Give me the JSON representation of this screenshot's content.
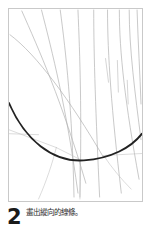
{
  "page": {
    "background_color": "#ffffff",
    "width": 152,
    "height": 235
  },
  "illustration": {
    "name": "drawing-step-illustration",
    "frame": {
      "border_color": "#c9c9c9",
      "fill_color": "#ffffff"
    },
    "description": "Sketch of a fan/shell shape: many thin curved radiating construction lines converging toward the upper right, crossed by a bold dark U-shaped arc forming the lower boundary.",
    "stroke_colors": {
      "construction_line": "#b0b0b0",
      "emphasis_arc": "#222222",
      "light_line": "#c4c4c4"
    },
    "stroke_widths": {
      "construction_line": 0.7,
      "emphasis_arc": 1.9,
      "light_line": 0.6
    },
    "radiating_lines": [
      {
        "id": "ray-1",
        "d": "M 1 26 C 28 46 62 92 96 150"
      },
      {
        "id": "ray-2",
        "d": "M 13 2 C 30 40 54 94 78 176"
      },
      {
        "id": "ray-3",
        "d": "M 33 1 C 44 44 58 98 70 186"
      },
      {
        "id": "ray-4",
        "d": "M 52 1 C 58 46 64 100 66 190"
      },
      {
        "id": "ray-5",
        "d": "M 70 1 C 72 48 74 104 72 190"
      },
      {
        "id": "ray-6",
        "d": "M 86 1 C 86 48 88 106 92 190"
      },
      {
        "id": "ray-7",
        "d": "M 100 1 C 100 46 104 102 114 186"
      },
      {
        "id": "ray-8",
        "d": "M 112 1 C 112 44 118 96 132 172"
      },
      {
        "id": "ray-9",
        "d": "M 122 1 C 122 40 128 86 134 132"
      },
      {
        "id": "ray-10",
        "d": "M 130 1 C 131 34 133 66 134 96"
      }
    ],
    "short_marks": [
      {
        "id": "mark-1",
        "d": "M 98 50 L 101 74"
      },
      {
        "id": "mark-2",
        "d": "M 110 52 L 111 84"
      },
      {
        "id": "mark-3",
        "d": "M 120 72 L 121 96"
      }
    ],
    "emphasis_arc": {
      "id": "bold-u-arc",
      "d": "M 0 95 C 16 132 44 155 76 153 C 104 151 124 140 135 126"
    },
    "lower_lines": [
      {
        "id": "lower-ray-1",
        "d": "M 0 122 L 48 140"
      },
      {
        "id": "lower-ray-2",
        "d": "M 0 126 L 30 127"
      },
      {
        "id": "lower-ray-3",
        "d": "M 48 140 C 44 156 38 174 30 192"
      },
      {
        "id": "lower-ray-4",
        "d": "M 72 152 C 72 166 72 180 72 192"
      },
      {
        "id": "lower-ray-5",
        "d": "M 96 148 C 104 160 114 172 124 182"
      },
      {
        "id": "lower-ray-6",
        "d": "M 96 148 L 135 146"
      },
      {
        "id": "lower-ray-7",
        "d": "M 48 140 L 72 152"
      }
    ]
  },
  "caption": {
    "step_number": "2",
    "text": "畫出縱向的線條。",
    "text_color": "#2b2b2b",
    "number_color": "#1a1a1a"
  }
}
